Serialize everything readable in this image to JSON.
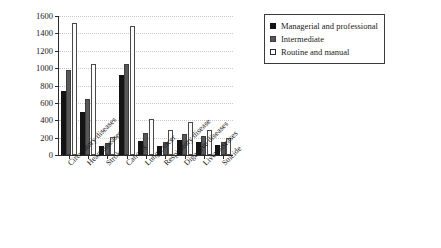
{
  "chart_data": {
    "type": "bar",
    "title": "",
    "subtitle": "",
    "xlabel": "",
    "ylabel": "Deaths per million",
    "ylim": [
      0,
      1600
    ],
    "ytick_step": 200,
    "yticks": [
      0,
      200,
      400,
      600,
      800,
      1000,
      1200,
      1400,
      1600
    ],
    "grid": "horizontal-dotted",
    "legend_position": "right-top",
    "categories": [
      "Circulatory diseases",
      "Heart diseases",
      "Stroke",
      "Cancers",
      "Lung cancer",
      "Respiratory disease",
      "Digestive diseases",
      "Liver diseases",
      "Suicide"
    ],
    "series": [
      {
        "name": "Managerial and professional",
        "color": "#141414",
        "values": [
          740,
          500,
          105,
          920,
          165,
          105,
          170,
          150,
          115
        ]
      },
      {
        "name": "Intermediate",
        "color": "#585858",
        "values": [
          975,
          645,
          135,
          1050,
          255,
          150,
          240,
          215,
          155
        ]
      },
      {
        "name": "Routine and manual",
        "color": "#ffffff",
        "values": [
          1525,
          1045,
          205,
          1490,
          420,
          290,
          375,
          290,
          200
        ]
      }
    ]
  },
  "legend": {
    "entries": [
      {
        "label": "Managerial and professional"
      },
      {
        "label": "Intermediate"
      },
      {
        "label": "Routine and manual"
      }
    ]
  }
}
